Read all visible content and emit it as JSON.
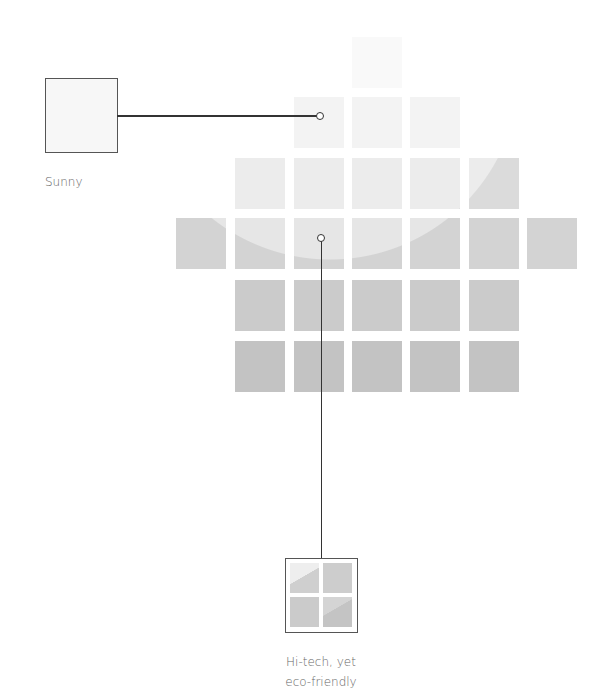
{
  "diagram": {
    "tiles": {
      "rows": [
        {
          "y": 37,
          "cols": [
            352
          ]
        },
        {
          "y": 97,
          "cols": [
            294,
            352,
            410
          ]
        },
        {
          "y": 158,
          "cols": [
            235,
            294,
            352,
            410,
            469
          ]
        },
        {
          "y": 218,
          "cols": [
            176,
            235,
            294,
            352,
            410,
            469,
            527
          ]
        },
        {
          "y": 280,
          "cols": [
            235,
            294,
            352,
            410,
            469
          ]
        },
        {
          "y": 341,
          "cols": [
            235,
            294,
            352,
            410,
            469
          ]
        }
      ],
      "light_color": "#f5f5f5",
      "dark_color": "#c4c4c4",
      "glow_center": [
        330,
        70
      ],
      "glow_radius": 190
    },
    "callouts": [
      {
        "label": "Sunny"
      },
      {
        "label_line1": "Hi-tech, yet",
        "label_line2": "eco-friendly"
      }
    ]
  }
}
